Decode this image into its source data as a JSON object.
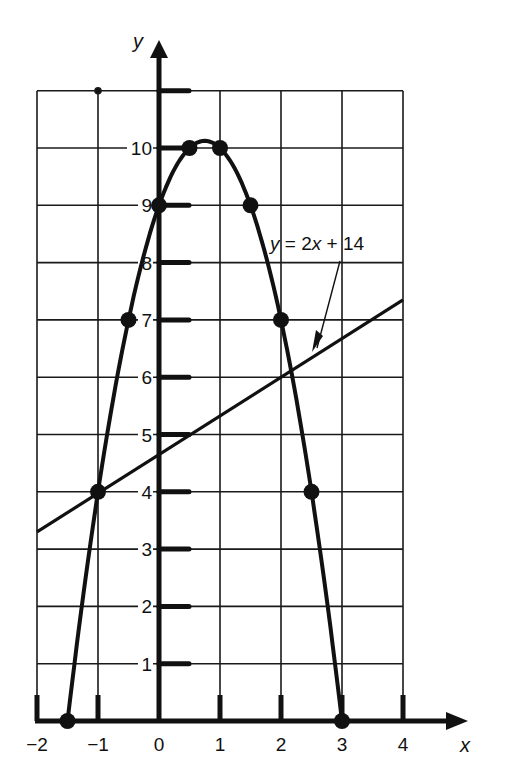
{
  "chart_data": {
    "type": "line",
    "title": "",
    "xlabel": "x",
    "ylabel": "y",
    "xlim": [
      -2,
      4
    ],
    "ylim": [
      0,
      11
    ],
    "grid": true,
    "x_ticks": [
      -2,
      -1,
      0,
      1,
      2,
      3,
      4
    ],
    "x_tick_labels": [
      "−2",
      "−1",
      "0",
      "1",
      "2",
      "3",
      "4"
    ],
    "y_ticks": [
      1,
      2,
      3,
      4,
      5,
      6,
      7,
      8,
      9,
      10
    ],
    "y_tick_labels": [
      "1",
      "2",
      "3",
      "4",
      "5",
      "6",
      "7",
      "8",
      "9",
      "10"
    ],
    "series": [
      {
        "name": "parabola",
        "style": "curve-with-markers",
        "x": [
          -1.5,
          -1,
          -0.5,
          0,
          0.5,
          1,
          1.5,
          2,
          2.5,
          3
        ],
        "y": [
          0,
          4,
          7,
          9,
          10,
          10,
          9,
          7,
          4,
          0
        ]
      },
      {
        "name": "y = 2x + 14",
        "style": "line",
        "x": [
          -2,
          4
        ],
        "y": [
          3.3,
          7.35
        ]
      }
    ],
    "annotations": [
      {
        "text": "y = 2x + 14",
        "points_to": "line"
      }
    ]
  },
  "labels": {
    "x_axis": "x",
    "y_axis": "y",
    "line_annotation": "y = 2x + 14"
  }
}
